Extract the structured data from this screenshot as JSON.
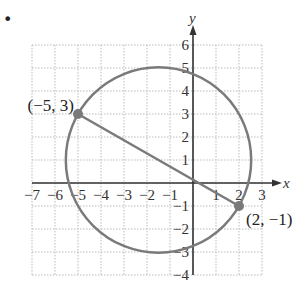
{
  "problem_marker": "•",
  "chart_data": {
    "type": "scatter",
    "title": "",
    "xlabel": "x",
    "ylabel": "y",
    "xlim": [
      -7,
      3
    ],
    "ylim": [
      -4,
      6
    ],
    "grid": true,
    "x_ticks": [
      "−7",
      "−6",
      "−5",
      "−4",
      "−3",
      "−2",
      "−1",
      "1",
      "2",
      "3"
    ],
    "x_tick_values": [
      -7,
      -6,
      -5,
      -4,
      -3,
      -2,
      -1,
      1,
      2,
      3
    ],
    "y_ticks": [
      "6",
      "5",
      "4",
      "3",
      "2",
      "1",
      "−1",
      "−2",
      "−3",
      "−4"
    ],
    "y_tick_values": [
      6,
      5,
      4,
      3,
      2,
      1,
      -1,
      -2,
      -3,
      -4
    ],
    "points": [
      {
        "x": -5,
        "y": 3,
        "label": "(−5, 3)"
      },
      {
        "x": 2,
        "y": -1,
        "label": "(2, −1)"
      }
    ],
    "segment": {
      "from": [
        -5,
        3
      ],
      "to": [
        2,
        -1
      ]
    },
    "circle": {
      "center": [
        -1.5,
        1
      ],
      "radius": 4.03,
      "note": "circle with diameter endpoints (−5, 3) and (2, −1)"
    },
    "colors": {
      "curve": "#7a7a7a",
      "axis": "#333333",
      "grid": "#bbbbbb"
    }
  }
}
